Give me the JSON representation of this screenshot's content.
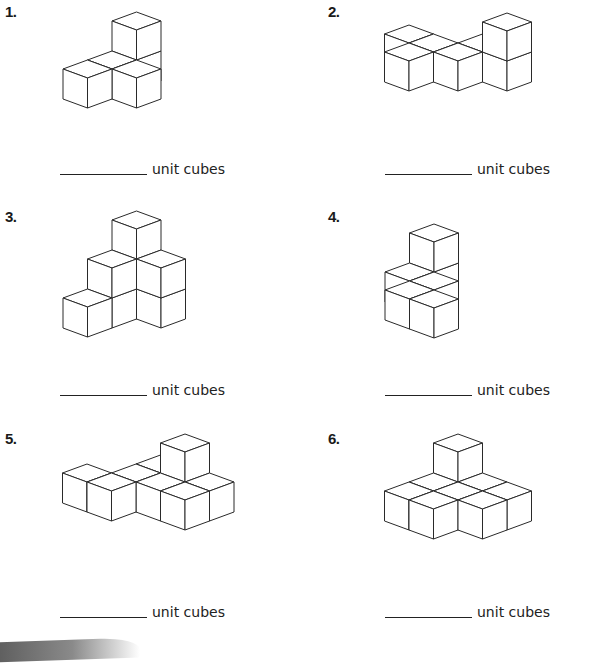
{
  "worksheet": {
    "unit_label": "unit cubes",
    "problems": [
      {
        "number": "1.",
        "label_pos": [
          5,
          3
        ],
        "answer_pos": [
          60,
          160
        ],
        "answer": "",
        "origin": [
          136.5,
          60
        ],
        "cubes": [
          [
            0,
            0,
            0
          ],
          [
            0,
            0,
            1
          ],
          [
            0,
            1,
            0
          ],
          [
            1,
            1,
            0
          ],
          [
            0,
            2,
            0
          ]
        ]
      },
      {
        "number": "2.",
        "label_pos": [
          328,
          3
        ],
        "answer_pos": [
          385,
          160
        ],
        "answer": "",
        "origin": [
          409,
          61
        ],
        "cubes": [
          [
            -1,
            -1,
            0
          ],
          [
            0,
            -1,
            0
          ],
          [
            1,
            -2,
            0
          ],
          [
            0,
            0,
            0
          ],
          [
            1,
            -1,
            0
          ],
          [
            2,
            -2,
            0
          ],
          [
            2,
            -2,
            1
          ]
        ]
      },
      {
        "number": "3.",
        "label_pos": [
          5,
          208
        ],
        "answer_pos": [
          60,
          381
        ],
        "answer": "",
        "origin": [
          136.5,
          289
        ],
        "cubes": [
          [
            0,
            0,
            0
          ],
          [
            0,
            0,
            1
          ],
          [
            0,
            0,
            2
          ],
          [
            0,
            1,
            0
          ],
          [
            0,
            1,
            1
          ],
          [
            1,
            0,
            0
          ],
          [
            1,
            0,
            1
          ],
          [
            0,
            2,
            0
          ]
        ]
      },
      {
        "number": "4.",
        "label_pos": [
          328,
          208
        ],
        "answer_pos": [
          385,
          381
        ],
        "answer": "",
        "origin": [
          434,
          272
        ],
        "cubes": [
          [
            0,
            0,
            0
          ],
          [
            0,
            0,
            1
          ],
          [
            0,
            1,
            0
          ],
          [
            1,
            1,
            0
          ],
          [
            1,
            2,
            0
          ],
          [
            2,
            2,
            0
          ]
        ]
      },
      {
        "number": "5.",
        "label_pos": [
          5,
          430
        ],
        "answer_pos": [
          60,
          603
        ],
        "answer": "",
        "origin": [
          185,
          482
        ],
        "cubes": [
          [
            -1,
            0,
            0
          ],
          [
            -1,
            1,
            0
          ],
          [
            0,
            0,
            0
          ],
          [
            0,
            0,
            1
          ],
          [
            0,
            1,
            0
          ],
          [
            1,
            0,
            0
          ],
          [
            -2,
            2,
            0
          ],
          [
            -1,
            2,
            0
          ],
          [
            1,
            1,
            0
          ]
        ]
      },
      {
        "number": "6.",
        "label_pos": [
          328,
          430
        ],
        "answer_pos": [
          385,
          603
        ],
        "answer": "",
        "origin": [
          458,
          482
        ],
        "cubes": [
          [
            0,
            0,
            0
          ],
          [
            0,
            0,
            1
          ],
          [
            0,
            1,
            0
          ],
          [
            1,
            0,
            0
          ],
          [
            0,
            2,
            0
          ],
          [
            1,
            1,
            0
          ],
          [
            2,
            0,
            0
          ],
          [
            1,
            2,
            0
          ],
          [
            2,
            1,
            0
          ]
        ]
      }
    ]
  },
  "cube_geometry": {
    "dx": 24.5,
    "dy": 9,
    "height": 30,
    "stroke": "#2a2a2a",
    "fill": "#ffffff"
  },
  "decor": {
    "swoosh_color": "#6b6b6b"
  }
}
